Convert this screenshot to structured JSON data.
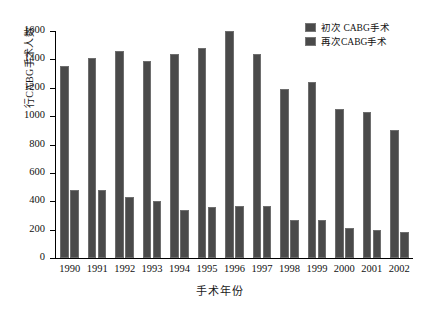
{
  "chart_data": {
    "type": "bar",
    "title": "",
    "xlabel": "手术年份",
    "ylabel": "行CABG手术人数",
    "categories": [
      "1990",
      "1991",
      "1992",
      "1993",
      "1994",
      "1995",
      "1996",
      "1997",
      "1998",
      "1999",
      "2000",
      "2001",
      "2002"
    ],
    "series": [
      {
        "name": "初次 CABG手术",
        "color": "#4a4a4a",
        "values": [
          1350,
          1410,
          1460,
          1390,
          1440,
          1480,
          1600,
          1440,
          1190,
          1240,
          1050,
          1030,
          900
        ]
      },
      {
        "name": "再次CABG手术",
        "color": "#4a4a4a",
        "values": [
          480,
          480,
          430,
          400,
          340,
          360,
          370,
          370,
          270,
          270,
          210,
          200,
          180
        ]
      }
    ],
    "ylim": [
      0,
      1600
    ],
    "yticks": [
      0,
      200,
      400,
      600,
      800,
      1000,
      1200,
      1400,
      1600
    ],
    "ytick_labels": [
      "0",
      "200",
      "400",
      "600",
      "800",
      "1000",
      "1200",
      "1400",
      "1600"
    ],
    "grid": false,
    "legend_position": "top-right"
  },
  "legend": {
    "entries": [
      {
        "label": "初次 CABG手术"
      },
      {
        "label": "再次CABG手术"
      }
    ]
  },
  "axes": {
    "x_title": "手术年份",
    "y_title": "行CABG手术人数"
  }
}
